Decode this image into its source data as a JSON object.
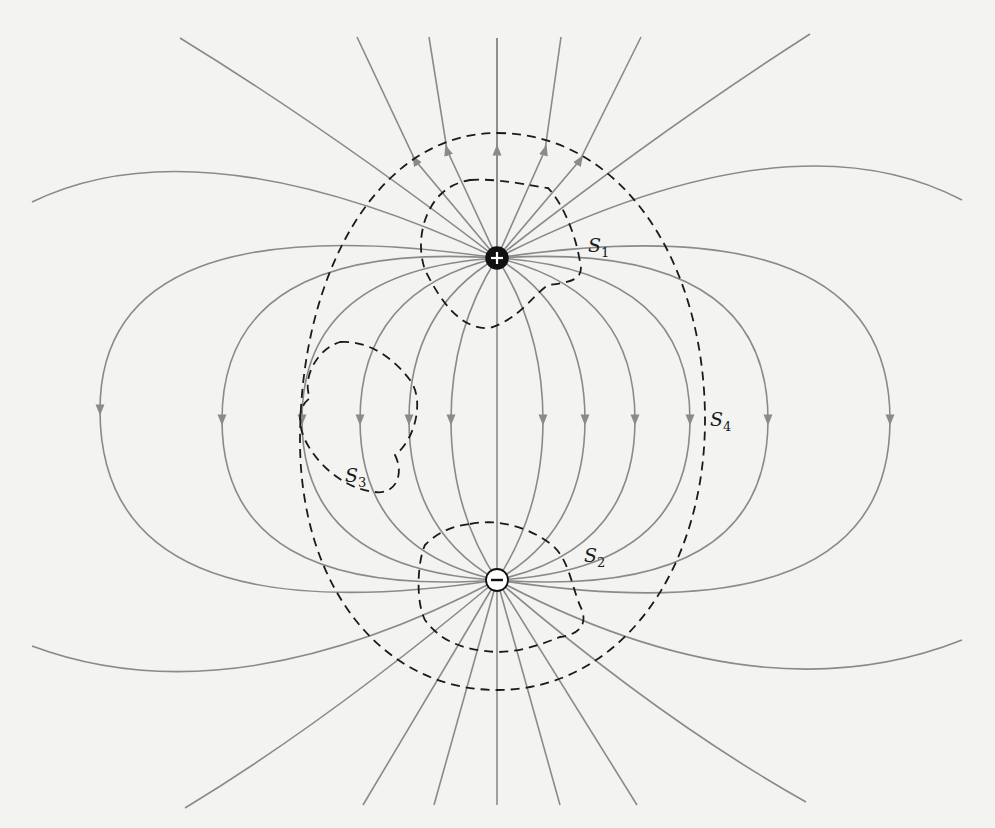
{
  "figure": {
    "charges": [
      {
        "name": "positive-charge",
        "symbol": "+",
        "x": 497,
        "y": 258,
        "r": 11,
        "fill": "#111111",
        "glyph_color": "#ffffff"
      },
      {
        "name": "negative-charge",
        "symbol": "−",
        "x": 497,
        "y": 580,
        "r": 11,
        "fill": "#ffffff",
        "glyph_color": "#111111"
      }
    ],
    "surfaces": [
      {
        "id": "S1",
        "base": "S",
        "sub": "1",
        "label_x": 588,
        "label_y": 236
      },
      {
        "id": "S2",
        "base": "S",
        "sub": "2",
        "label_x": 584,
        "label_y": 546
      },
      {
        "id": "S3",
        "base": "S",
        "sub": "3",
        "label_x": 345,
        "label_y": 466
      },
      {
        "id": "S4",
        "base": "S",
        "sub": "4",
        "label_x": 710,
        "label_y": 410
      }
    ],
    "colors": {
      "background": "#f3f3f1",
      "field_line": "#8a8a8a",
      "surface_line": "#1a1a1a"
    }
  }
}
